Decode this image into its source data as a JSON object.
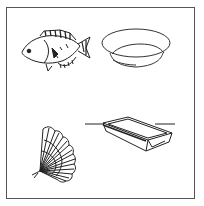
{
  "figure": {
    "frame_color": "#555555",
    "stroke_color": "#222222",
    "background": "#ffffff",
    "items": [
      {
        "name": "fish",
        "position": "top-left"
      },
      {
        "name": "bowl",
        "position": "top-right"
      },
      {
        "name": "fan",
        "position": "bottom-left"
      },
      {
        "name": "tray",
        "position": "bottom-right"
      }
    ]
  }
}
